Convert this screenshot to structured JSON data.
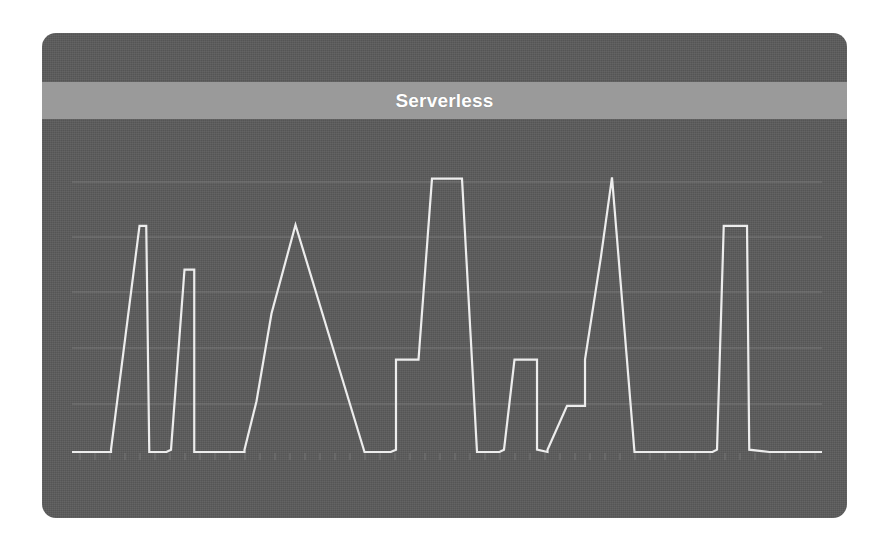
{
  "card": {
    "background_color": "#5b5b5b",
    "corner_radius_px": 14
  },
  "header": {
    "title": "Serverless",
    "band_color": "#9a9a9a",
    "title_color": "#ffffff"
  },
  "chart_data": {
    "type": "line",
    "title": "Serverless",
    "xlabel": "",
    "ylabel": "",
    "grid": true,
    "legend_position": "none",
    "line_color": "#ededed",
    "gridline_color": "#8e8e8e",
    "xlim": [
      0,
      100
    ],
    "ylim": [
      0,
      6
    ],
    "y_gridlines": [
      1,
      2,
      3,
      4,
      5
    ],
    "series": [
      {
        "name": "utilization",
        "x": [
          0.0,
          5.2,
          5.2,
          9.0,
          9.9,
          10.3,
          10.3,
          12.6,
          13.2,
          15.0,
          16.3,
          16.3,
          21.0,
          23.0,
          23.0,
          24.6,
          26.6,
          29.8,
          29.8,
          39.0,
          39.0,
          42.5,
          43.2,
          43.2,
          46.2,
          48.0,
          52.0,
          54.0,
          54.0,
          57.0,
          57.6,
          59.0,
          62.0,
          62.0,
          63.4,
          63.4,
          66.0,
          68.0,
          68.4,
          68.4,
          70.5,
          72.0,
          72.0,
          75.0,
          85.4,
          86.0,
          86.9,
          89.2,
          90.0,
          90.3,
          93.0,
          100.0
        ],
        "y": [
          0.0,
          0.0,
          0.05,
          4.9,
          4.9,
          0.05,
          0.0,
          0.0,
          0.05,
          3.95,
          3.95,
          0.0,
          0.0,
          0.0,
          0.05,
          1.1,
          3.0,
          4.92,
          4.92,
          0.0,
          0.0,
          0.0,
          0.05,
          2.0,
          2.0,
          5.92,
          5.92,
          0.0,
          0.0,
          0.0,
          0.05,
          2.0,
          2.0,
          0.05,
          0.0,
          0.05,
          1.0,
          1.0,
          1.0,
          2.0,
          4.2,
          5.95,
          5.95,
          0.0,
          0.0,
          0.05,
          4.9,
          4.9,
          4.9,
          0.05,
          0.0,
          0.0
        ],
        "spikes": [
          {
            "index": 1,
            "peak_value": 4.9,
            "shape": "narrow-triangle"
          },
          {
            "index": 2,
            "peak_value": 3.95,
            "shape": "narrow-triangle"
          },
          {
            "index": 3,
            "peak_value": 4.92,
            "shape": "ramp-triangle"
          },
          {
            "index": 4,
            "peak_value": 5.92,
            "shape": "stepped-triangle-with-shoulder"
          },
          {
            "index": 5,
            "peak_value": 2.0,
            "shape": "short-plateau"
          },
          {
            "index": 6,
            "peak_value": 5.95,
            "shape": "stepped-spike-with-shoulder"
          },
          {
            "index": 7,
            "peak_value": 4.9,
            "shape": "wide-plateau"
          }
        ]
      }
    ]
  },
  "plot_geometry": {
    "baseline_y_px": 419,
    "gridlines_y_px": [
      149,
      204,
      259,
      315,
      371
    ],
    "left_px": 30,
    "right_px": 780
  }
}
